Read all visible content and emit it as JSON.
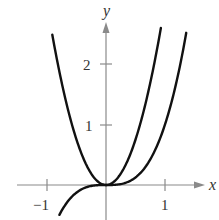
{
  "chart_data": {
    "type": "line",
    "title": "",
    "xlabel": "x",
    "ylabel": "y",
    "xlim": [
      -1.1,
      1.5
    ],
    "ylim": [
      -0.6,
      2.7
    ],
    "grid": false,
    "legend": null,
    "x_ticks": [
      {
        "value": -1,
        "label": "−1"
      },
      {
        "value": 1,
        "label": "1"
      }
    ],
    "y_ticks": [
      {
        "value": 1,
        "label": "1"
      },
      {
        "value": 2,
        "label": "2"
      }
    ],
    "series": [
      {
        "name": "y = 3x^2 (parabola)",
        "formula": "3*x^2",
        "domain": [
          -0.91,
          0.93
        ],
        "x": [
          -0.9,
          -0.6,
          -0.3,
          0,
          0.3,
          0.6,
          0.9
        ],
        "values": [
          2.43,
          1.08,
          0.27,
          0,
          0.27,
          1.08,
          2.43
        ]
      },
      {
        "name": "y = x^3 (cubic)",
        "formula": "x^3",
        "domain": [
          -0.79,
          1.36
        ],
        "x": [
          -0.78,
          -0.5,
          0,
          0.5,
          1.0,
          1.36
        ],
        "values": [
          -0.47,
          -0.125,
          0,
          0.125,
          1.0,
          2.5
        ]
      }
    ],
    "color": "#111111"
  },
  "axes": {
    "x_label": "x",
    "y_label": "y",
    "tick_x_neg1": "−1",
    "tick_x_1": "1",
    "tick_y_1": "1",
    "tick_y_2": "2"
  }
}
